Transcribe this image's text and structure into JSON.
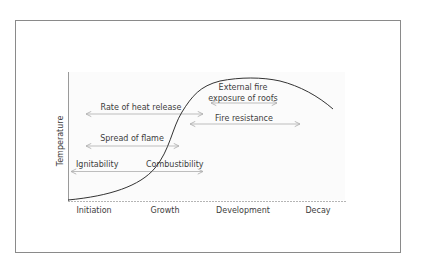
{
  "diagram": {
    "y_axis_label": "Temperature",
    "x_axis_stages": [
      "Initiation",
      "Growth",
      "Development",
      "Decay"
    ],
    "curve": "Fire temperature development curve",
    "annotations": {
      "rate_of_heat_release": "Rate of heat release",
      "spread_of_flame": "Spread of flame",
      "ignitability": "Ignitability",
      "combustibility": "Combustibility",
      "external_fire_line1": "External fire",
      "external_fire_line2": "exposure of roofs",
      "fire_resistance": "Fire resistance"
    },
    "colors": {
      "curve": "#333333",
      "arrows": "#b8b8b8",
      "frame": "#8a8a8a",
      "text": "#3d3d3d"
    }
  }
}
